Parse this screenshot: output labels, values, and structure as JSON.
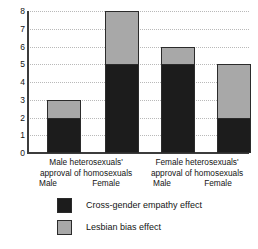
{
  "chart_data": {
    "type": "bar",
    "subtype": "stacked-bar",
    "title": "",
    "xlabel": "",
    "ylabel": "",
    "ylim": [
      0,
      8
    ],
    "yticks": [
      8,
      7,
      6,
      5,
      4,
      3,
      2,
      1,
      0
    ],
    "ytick_labels": [
      "8",
      "7",
      "6",
      "5",
      "4",
      "3",
      "2",
      "1",
      "0"
    ],
    "grid": true,
    "legend_position": "bottom",
    "groups": [
      {
        "label_line1": "Male heterosexuals'",
        "label_line2": "approval of homosexuals",
        "bars": [
          "Male",
          "Female"
        ]
      },
      {
        "label_line1": "Female heterosexuals'",
        "label_line2": "approval of homosexuals",
        "bars": [
          "Male",
          "Female"
        ]
      }
    ],
    "categories": [
      "Male heterosexuals' approval of homosexuals - Male",
      "Male heterosexuals' approval of homosexuals - Female",
      "Female heterosexuals' approval of homosexuals - Male",
      "Female heterosexuals' approval of homosexuals - Female"
    ],
    "series": [
      {
        "name": "Cross-gender empathy effect",
        "color": "#1c1c1c",
        "values": [
          2,
          5,
          5,
          2
        ]
      },
      {
        "name": "Lesbian bias effect",
        "color": "#a8a8a8",
        "values": [
          1,
          3,
          1,
          3
        ]
      }
    ],
    "totals": [
      3,
      8,
      6,
      5
    ]
  },
  "legend": {
    "items": [
      {
        "label": "Cross-gender empathy effect",
        "color": "#1c1c1c"
      },
      {
        "label": "Lesbian bias effect",
        "color": "#a8a8a8"
      }
    ]
  }
}
